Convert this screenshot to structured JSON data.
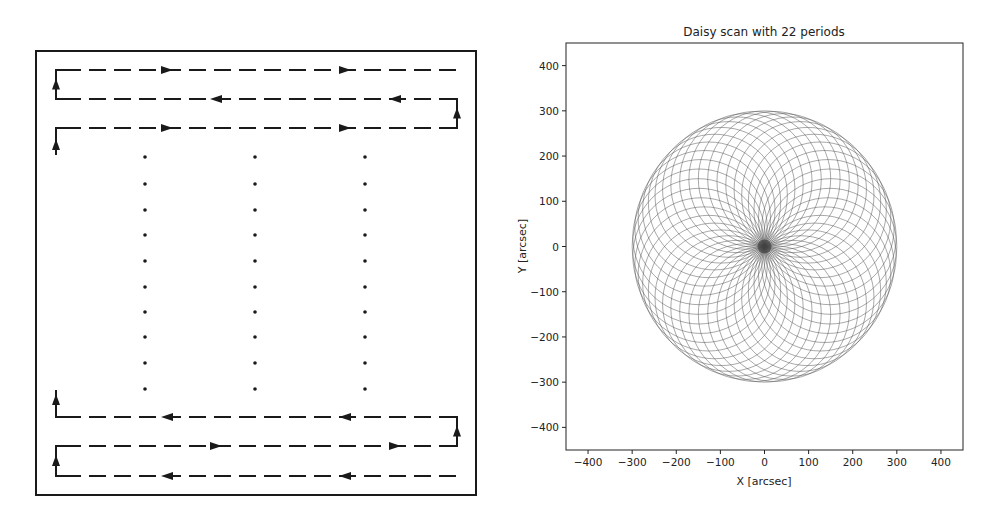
{
  "chart_data": [
    {
      "type": "diagram",
      "title": "",
      "description": "Raster (boustrophedon) scan pattern with dashed scan lines and direction arrows",
      "frame": {
        "x": 36,
        "y": 51,
        "width": 440,
        "height": 444
      },
      "left_turn_x": 56,
      "right_turn_x": 457,
      "line_start_x": 56,
      "line_end_x": 457,
      "scan_rows": [
        {
          "y": 70,
          "direction": "right",
          "arrows_x": [
            167,
            345
          ],
          "turn_left_from_y": 99,
          "open_end": "right"
        },
        {
          "y": 99,
          "direction": "left",
          "arrows_x": [
            216,
            395
          ],
          "turn_right_from_y": 128
        },
        {
          "y": 128,
          "direction": "right",
          "arrows_x": [
            167,
            345
          ],
          "entry_from_y": 155
        },
        {
          "y": 417,
          "direction": "left",
          "arrows_x": [
            167,
            345
          ],
          "exit_to_y": 390
        },
        {
          "y": 446,
          "direction": "right",
          "arrows_x": [
            216,
            395
          ],
          "turn_right_to_y": 417
        },
        {
          "y": 476,
          "direction": "left",
          "arrows_x": [
            167,
            345
          ],
          "turn_left_to_y": 446
        }
      ],
      "ellipsis_dots": {
        "columns_x": [
          145,
          255,
          365
        ],
        "rows_y": [
          157,
          184,
          210,
          235,
          261,
          287,
          312,
          337,
          363,
          389
        ]
      }
    },
    {
      "type": "line",
      "title": "Daisy scan with 22 periods",
      "xlabel": "X [arcsec]",
      "ylabel": "Y [arcsec]",
      "xlim": [
        -450,
        450
      ],
      "ylim": [
        -450,
        450
      ],
      "xticks": [
        -400,
        -300,
        -200,
        -100,
        0,
        100,
        200,
        300,
        400
      ],
      "yticks": [
        400,
        300,
        200,
        100,
        0,
        -100,
        -200,
        -300,
        -400
      ],
      "xtick_labels": [
        "−400",
        "−300",
        "−200",
        "−100",
        "0",
        "100",
        "200",
        "300",
        "400"
      ],
      "ytick_labels": [
        "400",
        "300",
        "200",
        "100",
        "0",
        "−100",
        "−200",
        "−300",
        "−400"
      ],
      "grid": false,
      "legend": null,
      "series": [
        {
          "name": "daisy",
          "periods": 22,
          "petals": 44,
          "radius_arcsec": 300,
          "color": "#555555",
          "line_width": 0.6
        }
      ]
    }
  ],
  "layout": {
    "plot_frame": {
      "left": 566,
      "top": 43,
      "right": 963,
      "bottom": 450
    }
  }
}
